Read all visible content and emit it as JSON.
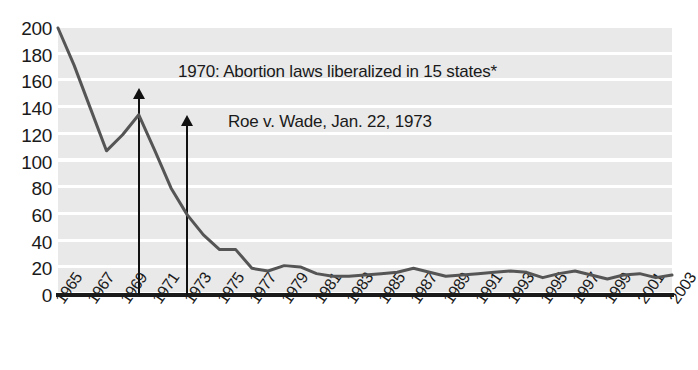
{
  "chart_data": {
    "type": "line",
    "title": "",
    "xlabel": "",
    "ylabel": "",
    "ylim": [
      0,
      200
    ],
    "xlim": [
      1965,
      2003
    ],
    "grid": true,
    "legend": "none",
    "y_ticks": [
      "200",
      "180",
      "160",
      "140",
      "120",
      "100",
      "80",
      "60",
      "40",
      "20",
      "0"
    ],
    "x_ticks": [
      "1965",
      "1967",
      "1969",
      "1971",
      "1973",
      "1975",
      "1977",
      "1979",
      "1981",
      "1983",
      "1985",
      "1987",
      "1989",
      "1991",
      "1993",
      "1995",
      "1997",
      "1999",
      "2001",
      "2003"
    ],
    "x": [
      1965,
      1966,
      1967,
      1968,
      1969,
      1970,
      1971,
      1972,
      1973,
      1974,
      1975,
      1976,
      1977,
      1978,
      1979,
      1980,
      1981,
      1982,
      1983,
      1984,
      1985,
      1986,
      1987,
      1988,
      1989,
      1990,
      1991,
      1992,
      1993,
      1994,
      1995,
      1996,
      1997,
      1998,
      1999,
      2000,
      2001,
      2002,
      2003
    ],
    "values": [
      200,
      172,
      140,
      108,
      120,
      135,
      108,
      80,
      60,
      45,
      34,
      34,
      20,
      18,
      22,
      21,
      16,
      14,
      14,
      15,
      16,
      17,
      20,
      17,
      14,
      15,
      16,
      17,
      18,
      17,
      13,
      16,
      18,
      15,
      12,
      15,
      16,
      13,
      15
    ],
    "series": [
      {
        "name": "Maternal deaths from abortion",
        "values": [
          200,
          172,
          140,
          108,
          120,
          135,
          108,
          80,
          60,
          45,
          34,
          34,
          20,
          18,
          22,
          21,
          16,
          14,
          14,
          15,
          16,
          17,
          20,
          17,
          14,
          15,
          16,
          17,
          18,
          17,
          13,
          16,
          18,
          15,
          12,
          15,
          16,
          13,
          15
        ]
      }
    ],
    "line_color": "#555555",
    "band_color": "#e9e9e9",
    "gridline_color": "#ffffff",
    "annotations": [
      {
        "label": "1970: Abortion laws liberalized in 15 states*",
        "year": 1970,
        "arrow_from_value": 0,
        "arrow_to_value": 155
      },
      {
        "label": "Roe v. Wade, Jan. 22, 1973",
        "year": 1973,
        "arrow_from_value": 0,
        "arrow_to_value": 135
      }
    ]
  }
}
